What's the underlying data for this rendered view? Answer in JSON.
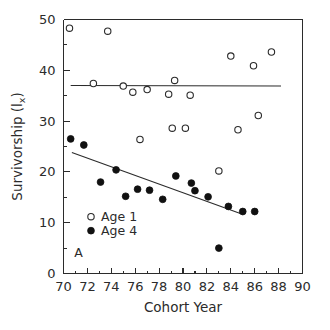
{
  "chart_data": {
    "type": "scatter",
    "title": "",
    "panel_label": "A",
    "xlabel": "Cohort Year",
    "ylabel": "Survivorship (lx)",
    "ylabel_main": "Survivorship (l",
    "ylabel_sub": "x",
    "ylabel_close": ")",
    "xlim": [
      70,
      90
    ],
    "ylim": [
      0,
      50
    ],
    "grid": false,
    "legend_position": "inside-lower-left",
    "xticks": [
      70,
      72,
      74,
      76,
      78,
      80,
      82,
      84,
      86,
      88,
      90
    ],
    "xticks_minor": [
      71,
      73,
      75,
      77,
      79,
      81,
      83,
      85,
      87,
      89
    ],
    "yticks": [
      0,
      10,
      20,
      30,
      40,
      50
    ],
    "yticks_minor": [
      5,
      15,
      25,
      35,
      45
    ],
    "xtick_labels": [
      "70",
      "72",
      "74",
      "76",
      "78",
      "80",
      "82",
      "84",
      "86",
      "88",
      "90"
    ],
    "ytick_labels": [
      "0",
      "10",
      "20",
      "30",
      "40",
      "50"
    ],
    "series": [
      {
        "name": "Age 1",
        "marker": "open-circle",
        "color": "#2b2b2b",
        "points": [
          [
            70.5,
            48.3
          ],
          [
            73.7,
            47.7
          ],
          [
            72.5,
            37.4
          ],
          [
            75.0,
            36.9
          ],
          [
            75.8,
            35.7
          ],
          [
            77.0,
            36.2
          ],
          [
            79.3,
            38.0
          ],
          [
            78.8,
            35.3
          ],
          [
            80.6,
            35.1
          ],
          [
            84.0,
            42.8
          ],
          [
            85.9,
            40.9
          ],
          [
            87.4,
            43.6
          ],
          [
            79.1,
            28.6
          ],
          [
            80.2,
            28.6
          ],
          [
            84.6,
            28.3
          ],
          [
            86.3,
            31.1
          ],
          [
            76.4,
            26.4
          ],
          [
            83.0,
            20.2
          ]
        ]
      },
      {
        "name": "Age 4",
        "marker": "filled-circle",
        "color": "#111111",
        "points": [
          [
            70.6,
            26.5
          ],
          [
            71.7,
            25.3
          ],
          [
            73.1,
            18.0
          ],
          [
            74.4,
            20.4
          ],
          [
            75.2,
            15.2
          ],
          [
            76.2,
            16.6
          ],
          [
            77.2,
            16.4
          ],
          [
            78.3,
            14.6
          ],
          [
            79.4,
            19.2
          ],
          [
            80.7,
            17.8
          ],
          [
            81.0,
            16.3
          ],
          [
            82.1,
            15.1
          ],
          [
            83.8,
            13.2
          ],
          [
            83.0,
            5.0
          ],
          [
            85.0,
            12.2
          ],
          [
            86.0,
            12.2
          ]
        ]
      }
    ],
    "fit_lines": [
      {
        "series": "Age 1",
        "x_start": 70.6,
        "y_start": 37.0,
        "x_end": 88.2,
        "y_end": 36.9,
        "description": "horizontal regression line for Age 1"
      },
      {
        "series": "Age 4",
        "x_start": 70.7,
        "y_start": 23.8,
        "x_end": 84.8,
        "y_end": 11.8,
        "description": "declining regression line for Age 4"
      }
    ],
    "legend": [
      {
        "label": "Age 1",
        "marker": "open-circle"
      },
      {
        "label": "Age 4",
        "marker": "filled-circle"
      }
    ]
  }
}
